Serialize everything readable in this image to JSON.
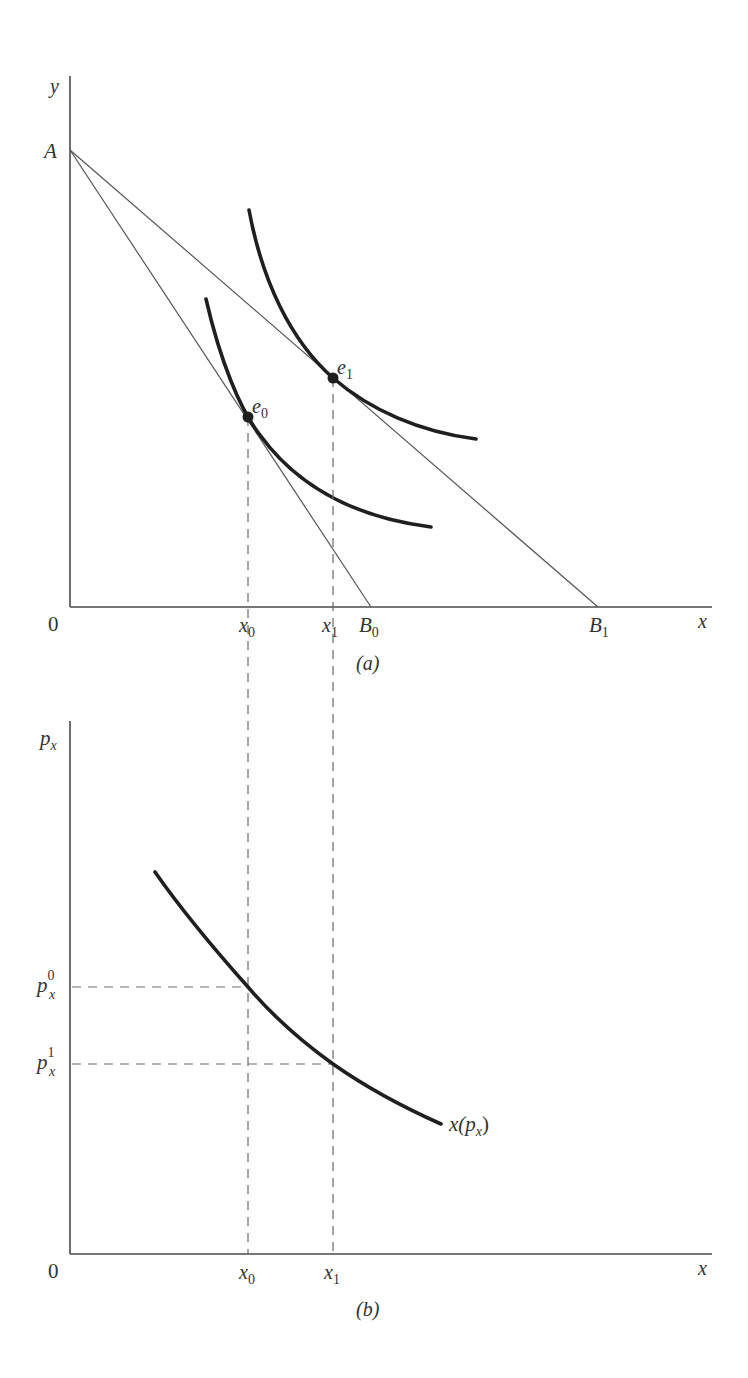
{
  "panel_a": {
    "caption": "(a)",
    "y_axis_label": "y",
    "x_axis_label": "x",
    "origin_label": "0",
    "intercept_label": "A",
    "budget_lines": [
      {
        "name": "AB0",
        "end_label": "B",
        "end_sub": "0"
      },
      {
        "name": "AB1",
        "end_label": "B",
        "end_sub": "1"
      }
    ],
    "equilibria": [
      {
        "label": "e",
        "sub": "0"
      },
      {
        "label": "e",
        "sub": "1"
      }
    ],
    "x_ticks": [
      {
        "label": "x",
        "sub": "0"
      },
      {
        "label": "x",
        "sub": "1"
      }
    ]
  },
  "panel_b": {
    "caption": "(b)",
    "y_axis_label": "p",
    "y_axis_sub": "x",
    "x_axis_label": "x",
    "origin_label": "0",
    "price_ticks": [
      {
        "label": "p",
        "sub": "x",
        "sup": "0"
      },
      {
        "label": "p",
        "sub": "x",
        "sup": "1"
      }
    ],
    "x_ticks": [
      {
        "label": "x",
        "sub": "0"
      },
      {
        "label": "x",
        "sub": "1"
      }
    ],
    "demand_curve_label": "x(p",
    "demand_curve_label_sub": "x",
    "demand_curve_label_close": ")"
  },
  "colors": {
    "background": "#ffffff",
    "curve": "#1f1f1f",
    "axis": "#4a4a4a",
    "dashed": "#6a6a6a"
  }
}
